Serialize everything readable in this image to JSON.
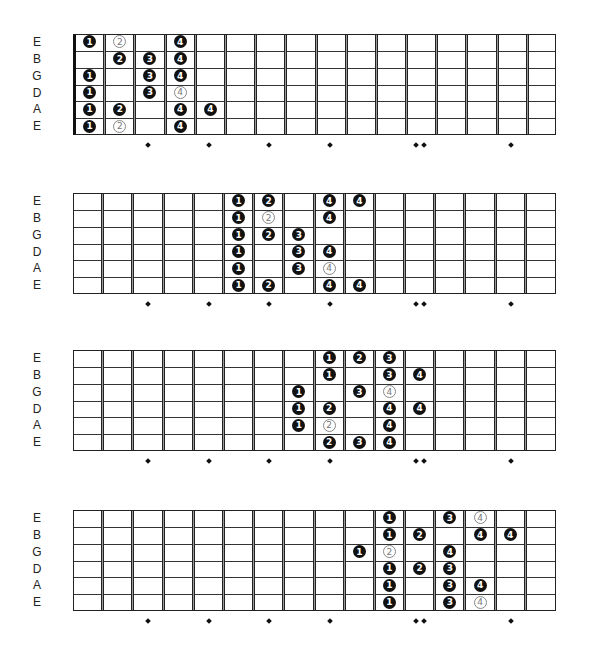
{
  "strings": [
    "E",
    "B",
    "G",
    "D",
    "A",
    "E"
  ],
  "fret_count": 16,
  "fret_markers": [
    {
      "fret": 3,
      "double": false
    },
    {
      "fret": 5,
      "double": false
    },
    {
      "fret": 7,
      "double": false
    },
    {
      "fret": 9,
      "double": false
    },
    {
      "fret": 12,
      "double": true
    },
    {
      "fret": 15,
      "double": false
    }
  ],
  "colors": {
    "filled_note": "#111111",
    "outline_note": "#888888",
    "background": "#ffffff"
  },
  "diagrams": [
    {
      "name": "position-1",
      "top": 34,
      "nut": true,
      "notes": [
        {
          "string": 0,
          "fret": 1,
          "finger": "1",
          "style": "filled"
        },
        {
          "string": 0,
          "fret": 2,
          "finger": "2",
          "style": "outline"
        },
        {
          "string": 0,
          "fret": 4,
          "finger": "4",
          "style": "filled"
        },
        {
          "string": 1,
          "fret": 2,
          "finger": "2",
          "style": "filled"
        },
        {
          "string": 1,
          "fret": 3,
          "finger": "3",
          "style": "filled"
        },
        {
          "string": 1,
          "fret": 4,
          "finger": "4",
          "style": "filled"
        },
        {
          "string": 2,
          "fret": 1,
          "finger": "1",
          "style": "filled"
        },
        {
          "string": 2,
          "fret": 3,
          "finger": "3",
          "style": "filled"
        },
        {
          "string": 2,
          "fret": 4,
          "finger": "4",
          "style": "filled"
        },
        {
          "string": 3,
          "fret": 1,
          "finger": "1",
          "style": "filled"
        },
        {
          "string": 3,
          "fret": 3,
          "finger": "3",
          "style": "filled"
        },
        {
          "string": 3,
          "fret": 4,
          "finger": "4",
          "style": "outline"
        },
        {
          "string": 4,
          "fret": 1,
          "finger": "1",
          "style": "filled"
        },
        {
          "string": 4,
          "fret": 2,
          "finger": "2",
          "style": "filled"
        },
        {
          "string": 4,
          "fret": 4,
          "finger": "4",
          "style": "filled"
        },
        {
          "string": 4,
          "fret": 5,
          "finger": "4",
          "style": "filled"
        },
        {
          "string": 5,
          "fret": 1,
          "finger": "1",
          "style": "filled"
        },
        {
          "string": 5,
          "fret": 2,
          "finger": "2",
          "style": "outline"
        },
        {
          "string": 5,
          "fret": 4,
          "finger": "4",
          "style": "filled"
        }
      ]
    },
    {
      "name": "position-2",
      "top": 193,
      "nut": false,
      "notes": [
        {
          "string": 0,
          "fret": 6,
          "finger": "1",
          "style": "filled"
        },
        {
          "string": 0,
          "fret": 7,
          "finger": "2",
          "style": "filled"
        },
        {
          "string": 0,
          "fret": 9,
          "finger": "4",
          "style": "filled"
        },
        {
          "string": 0,
          "fret": 10,
          "finger": "4",
          "style": "filled"
        },
        {
          "string": 1,
          "fret": 6,
          "finger": "1",
          "style": "filled"
        },
        {
          "string": 1,
          "fret": 7,
          "finger": "2",
          "style": "outline"
        },
        {
          "string": 1,
          "fret": 9,
          "finger": "4",
          "style": "filled"
        },
        {
          "string": 2,
          "fret": 6,
          "finger": "1",
          "style": "filled"
        },
        {
          "string": 2,
          "fret": 7,
          "finger": "2",
          "style": "filled"
        },
        {
          "string": 2,
          "fret": 8,
          "finger": "3",
          "style": "filled"
        },
        {
          "string": 3,
          "fret": 6,
          "finger": "1",
          "style": "filled"
        },
        {
          "string": 3,
          "fret": 8,
          "finger": "3",
          "style": "filled"
        },
        {
          "string": 3,
          "fret": 9,
          "finger": "4",
          "style": "filled"
        },
        {
          "string": 4,
          "fret": 6,
          "finger": "1",
          "style": "filled"
        },
        {
          "string": 4,
          "fret": 8,
          "finger": "3",
          "style": "filled"
        },
        {
          "string": 4,
          "fret": 9,
          "finger": "4",
          "style": "outline"
        },
        {
          "string": 5,
          "fret": 6,
          "finger": "1",
          "style": "filled"
        },
        {
          "string": 5,
          "fret": 7,
          "finger": "2",
          "style": "filled"
        },
        {
          "string": 5,
          "fret": 9,
          "finger": "4",
          "style": "filled"
        },
        {
          "string": 5,
          "fret": 10,
          "finger": "4",
          "style": "filled"
        }
      ]
    },
    {
      "name": "position-3",
      "top": 350,
      "nut": false,
      "notes": [
        {
          "string": 0,
          "fret": 9,
          "finger": "1",
          "style": "filled"
        },
        {
          "string": 0,
          "fret": 10,
          "finger": "2",
          "style": "filled"
        },
        {
          "string": 0,
          "fret": 11,
          "finger": "3",
          "style": "filled"
        },
        {
          "string": 1,
          "fret": 9,
          "finger": "1",
          "style": "filled"
        },
        {
          "string": 1,
          "fret": 11,
          "finger": "3",
          "style": "filled"
        },
        {
          "string": 1,
          "fret": 12,
          "finger": "4",
          "style": "filled"
        },
        {
          "string": 2,
          "fret": 8,
          "finger": "1",
          "style": "filled"
        },
        {
          "string": 2,
          "fret": 10,
          "finger": "3",
          "style": "filled"
        },
        {
          "string": 2,
          "fret": 11,
          "finger": "4",
          "style": "outline"
        },
        {
          "string": 3,
          "fret": 8,
          "finger": "1",
          "style": "filled"
        },
        {
          "string": 3,
          "fret": 9,
          "finger": "2",
          "style": "filled"
        },
        {
          "string": 3,
          "fret": 11,
          "finger": "4",
          "style": "filled"
        },
        {
          "string": 3,
          "fret": 12,
          "finger": "4",
          "style": "filled"
        },
        {
          "string": 4,
          "fret": 8,
          "finger": "1",
          "style": "filled"
        },
        {
          "string": 4,
          "fret": 9,
          "finger": "2",
          "style": "outline"
        },
        {
          "string": 4,
          "fret": 11,
          "finger": "4",
          "style": "filled"
        },
        {
          "string": 5,
          "fret": 9,
          "finger": "2",
          "style": "filled"
        },
        {
          "string": 5,
          "fret": 10,
          "finger": "3",
          "style": "filled"
        },
        {
          "string": 5,
          "fret": 11,
          "finger": "4",
          "style": "filled"
        }
      ]
    },
    {
      "name": "position-4",
      "top": 510,
      "nut": false,
      "notes": [
        {
          "string": 0,
          "fret": 11,
          "finger": "1",
          "style": "filled"
        },
        {
          "string": 0,
          "fret": 13,
          "finger": "3",
          "style": "filled"
        },
        {
          "string": 0,
          "fret": 14,
          "finger": "4",
          "style": "outline"
        },
        {
          "string": 1,
          "fret": 11,
          "finger": "1",
          "style": "filled"
        },
        {
          "string": 1,
          "fret": 12,
          "finger": "2",
          "style": "filled"
        },
        {
          "string": 1,
          "fret": 14,
          "finger": "4",
          "style": "filled"
        },
        {
          "string": 1,
          "fret": 15,
          "finger": "4",
          "style": "filled"
        },
        {
          "string": 2,
          "fret": 10,
          "finger": "1",
          "style": "filled"
        },
        {
          "string": 2,
          "fret": 11,
          "finger": "2",
          "style": "outline"
        },
        {
          "string": 2,
          "fret": 13,
          "finger": "4",
          "style": "filled"
        },
        {
          "string": 3,
          "fret": 11,
          "finger": "1",
          "style": "filled"
        },
        {
          "string": 3,
          "fret": 12,
          "finger": "2",
          "style": "filled"
        },
        {
          "string": 3,
          "fret": 13,
          "finger": "3",
          "style": "filled"
        },
        {
          "string": 4,
          "fret": 11,
          "finger": "1",
          "style": "filled"
        },
        {
          "string": 4,
          "fret": 13,
          "finger": "3",
          "style": "filled"
        },
        {
          "string": 4,
          "fret": 14,
          "finger": "4",
          "style": "filled"
        },
        {
          "string": 5,
          "fret": 11,
          "finger": "1",
          "style": "filled"
        },
        {
          "string": 5,
          "fret": 13,
          "finger": "3",
          "style": "filled"
        },
        {
          "string": 5,
          "fret": 14,
          "finger": "4",
          "style": "outline"
        }
      ]
    }
  ]
}
